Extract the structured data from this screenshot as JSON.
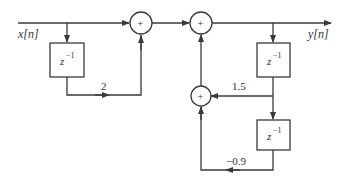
{
  "diagram": {
    "type": "signal-flow block diagram",
    "input_label": "x[n]",
    "output_label": "y[n]",
    "adder_symbol": "+",
    "delay_block": {
      "base": "z",
      "exponent": "−1"
    },
    "gains": {
      "feedforward": "2",
      "feedback_1": "1.5",
      "feedback_2": "−0.9"
    },
    "line_color": "#3a3a3a",
    "background": "#ffffff"
  }
}
